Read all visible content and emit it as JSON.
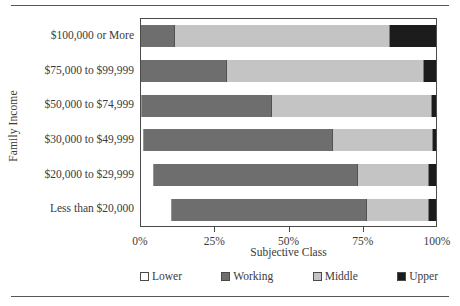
{
  "chart_data": {
    "type": "bar",
    "orientation": "horizontal",
    "stacked": true,
    "normalized_percent": true,
    "title": "",
    "xlabel": "Subjective Class",
    "ylabel": "Family Income",
    "xlim": [
      0,
      100
    ],
    "grid": false,
    "legend_position": "bottom",
    "xticks": [
      "0%",
      "25%",
      "50%",
      "75%",
      "100%"
    ],
    "xtick_values": [
      0,
      25,
      50,
      75,
      100
    ],
    "categories": [
      "$100,000 or More",
      "$75,000 to $99,999",
      "$50,000 to $74,999",
      "$30,000 to $49,999",
      "$20,000 to $29,999",
      "Less than $20,000"
    ],
    "series": [
      {
        "name": "Lower",
        "color": "#ffffff",
        "values": [
          0.0,
          0.0,
          0.5,
          1.0,
          4.5,
          10.5
        ]
      },
      {
        "name": "Working",
        "color": "#6e6e6e",
        "values": [
          11.5,
          29.0,
          44.0,
          64.0,
          69.0,
          66.0
        ]
      },
      {
        "name": "Middle",
        "color": "#c4c4c4",
        "values": [
          73.0,
          67.0,
          54.0,
          34.0,
          24.0,
          21.0
        ]
      },
      {
        "name": "Upper",
        "color": "#1c1c1c",
        "values": [
          15.5,
          4.0,
          1.5,
          1.0,
          2.5,
          2.5
        ]
      }
    ]
  },
  "legend": {
    "items": [
      {
        "label": "Lower",
        "color": "#ffffff"
      },
      {
        "label": "Working",
        "color": "#6e6e6e"
      },
      {
        "label": "Middle",
        "color": "#c4c4c4"
      },
      {
        "label": "Upper",
        "color": "#1c1c1c"
      }
    ]
  }
}
